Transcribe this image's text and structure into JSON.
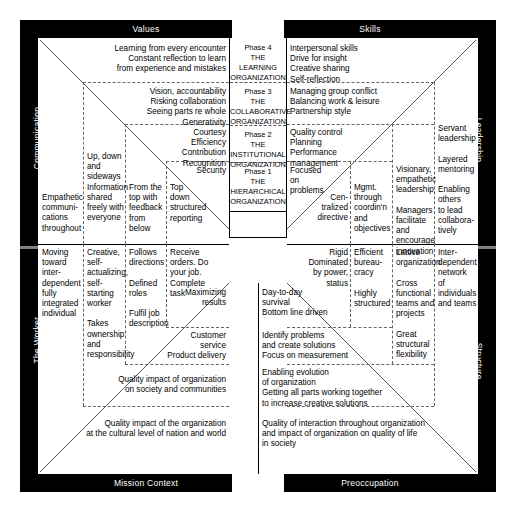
{
  "bands": {
    "top_left": "Values",
    "top_right": "Skills",
    "bottom_left": "Mission Context",
    "bottom_right": "Preoccupation",
    "left_upper": "Communication",
    "left_lower": "The Worker",
    "right_upper": "Leadership",
    "right_lower": "Structure"
  },
  "phases": [
    {
      "number": "Phase 4",
      "the": "THE",
      "name": "LEARNING\nORGANIZATION"
    },
    {
      "number": "Phase 3",
      "the": "THE",
      "name": "COLLABORATIVE\nORGANIZATION"
    },
    {
      "number": "Phase 2",
      "the": "THE",
      "name": "INSTITUTIONAL\nORGANIZATION"
    },
    {
      "number": "Phase 1",
      "the": "THE",
      "name": "HIERARCHICAL\nORGANIZATION"
    }
  ],
  "values": {
    "phase4": "Learning from every encounter\nConstant reflection to learn\nfrom experience and mistakes",
    "phase3": "Vision, accountability\nRisking collaboration\nSeeing parts re whole\nGenerativity",
    "phase2": "Courtesy\nEfficiency\nContribution\nRecognition",
    "phase1": "Security"
  },
  "skills": {
    "phase4": "Interpersonal skills\nDrive for insight\nCreative sharing\nSelf-reflection",
    "phase3": "Managing group conflict\nBalancing work & leisure\nPartnership style",
    "phase2": "Quality control\nPlanning\nPerformance\nmanagement",
    "phase1": "Focused\non\nproblems"
  },
  "communication": {
    "col1": "Empathetic\ncommuni-\ncations\nthroughout",
    "col2": "Up, down\nand\nsideways\nInformation\nshared\nfreely with\neveryone",
    "col3": "From the\ntop with\nfeedback\nfrom\nbelow",
    "col4": "Top\ndown\nstructured\nreporting"
  },
  "leadership": {
    "col1": "Cen-\ntralized\ndirective",
    "col2": "Mgmt.\nthrough\ncoordin'n\nand\nobjectives",
    "col3": "Visionary,\nempathetic\nleadership\n\nManagers\nfacilitate and\nencourage\ninnovation",
    "col4": "Servant\nleadership\n\nLayered\nmentoring\n\nEnabling\nothers\nto lead\ncollabora-\ntively"
  },
  "worker": {
    "col1": "Moving\ntoward\ninter-\ndependent\nfully\nintegrated\nindividual",
    "col2": "Creative,\nself-\nactualizing,\nself-starting\nworker\n\nTakes\nownership\nand\nresponsibility",
    "col3": "Follows\ndirections\n\nDefined\nroles\n\nFulfil job\ndescription",
    "col4": "Receive\norders. Do\nyour job.\nComplete\ntask"
  },
  "structure": {
    "col1": "Rigid\nDominated\nby power,\nstatus",
    "col2": "Efficient\nbureau-\ncracy\n\nHighly\nstructured",
    "col3": "Lattice\norganization\n\nCross\nfunctional\nteams and\nprojects\n\nGreat\nstructural\nflexibility",
    "col4": "Inter-\ndependent\nnetwork\nof\nindividuals\nand teams"
  },
  "mission_context": {
    "phase1": "Maximizing\nresults",
    "phase2": "Customer\nservice\nProduct delivery",
    "phase3": "Quality impact of organization\non society and communities",
    "phase4": "Quality impact of the organization\nat the cultural level of nation and world"
  },
  "preoccupation": {
    "phase1": "Day-to-day\nsurvival\nBottom line driven",
    "phase2": "Identify problems\nand create solutions\nFocus on measurement",
    "phase3": "Enabling evolution\nof organization\nGetting all parts working together\nto increase creative solutions",
    "phase4": "Quality of interaction throughout organization\nand impact of organization on quality of life\nin society"
  },
  "colors": {
    "frame": "#000000",
    "background": "#ffffff",
    "dashed": "#666666",
    "text": "#000000",
    "band_text": "#ffffff"
  }
}
